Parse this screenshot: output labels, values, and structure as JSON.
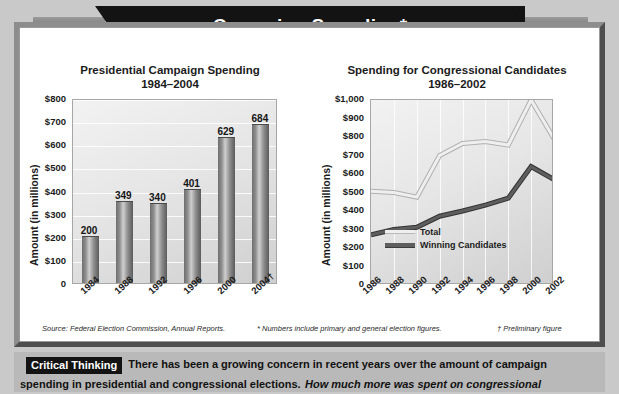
{
  "banner": {
    "title": "Campaign Spending*"
  },
  "chart_data": [
    {
      "type": "bar",
      "title": "Presidential Campaign Spending",
      "subtitle": "1984–2004",
      "ylabel": "Amount (in millions)",
      "xlabel": "",
      "categories": [
        "1984",
        "1988",
        "1992",
        "1996",
        "2000",
        "2004†"
      ],
      "values": [
        200,
        349,
        340,
        401,
        629,
        684
      ],
      "value_labels": [
        "200",
        "349",
        "340",
        "401",
        "629",
        "684"
      ],
      "ylim": [
        0,
        800
      ],
      "yticks": [
        "$800",
        "$700",
        "$600",
        "$500",
        "$400",
        "$300",
        "$200",
        "$100",
        "0"
      ],
      "ytick_values": [
        800,
        700,
        600,
        500,
        400,
        300,
        200,
        100,
        0
      ],
      "grid": true,
      "legend": "none",
      "bar_color": "#8c8c8c"
    },
    {
      "type": "line",
      "title": "Spending for Congressional Candidates",
      "subtitle": "1986–2002",
      "ylabel": "Amount (in millions)",
      "xlabel": "",
      "x": [
        "1986",
        "1988",
        "1990",
        "1992",
        "1994",
        "1996",
        "1998",
        "2000",
        "2002"
      ],
      "series": [
        {
          "name": "Total",
          "values": [
            507,
            500,
            475,
            700,
            765,
            775,
            757,
            1000,
            790
          ],
          "color": "#efefef"
        },
        {
          "name": "Winning Candidates",
          "values": [
            272,
            300,
            312,
            372,
            400,
            432,
            470,
            640,
            570
          ],
          "color": "#5e5e5e"
        }
      ],
      "ylim": [
        0,
        1000
      ],
      "yticks": [
        "$1,000",
        "$900",
        "$800",
        "$700",
        "$600",
        "$500",
        "$400",
        "$300",
        "$200",
        "$100",
        "0"
      ],
      "ytick_values": [
        1000,
        900,
        800,
        700,
        600,
        500,
        400,
        300,
        200,
        100,
        0
      ],
      "grid": true,
      "legend": "inside-bottom-left"
    }
  ],
  "footnotes": {
    "source": "Source: Federal Election Commission, Annual Reports.",
    "asterisk": "* Numbers include primary and general election figures.",
    "dagger": "† Preliminary figure"
  },
  "critical_thinking": {
    "badge": "Critical Thinking",
    "text": "There has been a growing concern in recent years over the amount of campaign spending in presidential and congressional elections.",
    "question": "How much more was spent on congressional"
  }
}
